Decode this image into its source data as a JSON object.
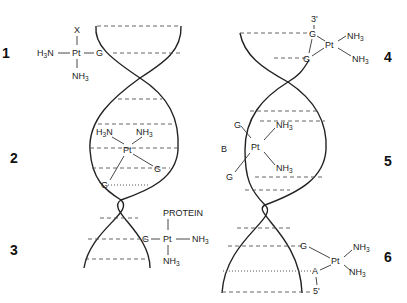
{
  "figure": {
    "adducts": [
      {
        "number": "1",
        "type": "monofunctional",
        "ligands": [
          "X",
          "H3N",
          "NH3"
        ],
        "base": "G",
        "metal": "Pt"
      },
      {
        "number": "2",
        "type": "interstrand cross-link",
        "ligands": [
          "H3N",
          "NH3"
        ],
        "bases": [
          "G",
          "G"
        ],
        "metal": "Pt"
      },
      {
        "number": "3",
        "type": "DNA-protein cross-link",
        "ligands": [
          "PROTEIN",
          "NH3",
          "NH3"
        ],
        "base": "G",
        "metal": "Pt"
      },
      {
        "number": "4",
        "type": "1,2-intrastrand GG",
        "ligands": [
          "NH3",
          "NH3"
        ],
        "bases": [
          "G",
          "G"
        ],
        "end": "3'",
        "metal": "Pt"
      },
      {
        "number": "5",
        "type": "1,3-intrastrand GBG",
        "ligands": [
          "NH3",
          "NH3"
        ],
        "bases": [
          "G",
          "B",
          "G"
        ],
        "metal": "Pt"
      },
      {
        "number": "6",
        "type": "1,2-intrastrand AG",
        "ligands": [
          "NH3",
          "NH3"
        ],
        "bases": [
          "G",
          "A"
        ],
        "end": "5'",
        "metal": "Pt"
      }
    ]
  },
  "labels": {
    "n1": "1",
    "n2": "2",
    "n3": "3",
    "n4": "4",
    "n5": "5",
    "n6": "6",
    "pt": "Pt",
    "g": "G",
    "a": "A",
    "b": "B",
    "x": "X",
    "h3n_main": "H",
    "h3n_sub": "3",
    "h3n_tail": "N",
    "nh3_main": "NH",
    "nh3_sub": "3",
    "protein": "PROTEIN",
    "three_prime": "3'",
    "five_prime": "5'"
  }
}
